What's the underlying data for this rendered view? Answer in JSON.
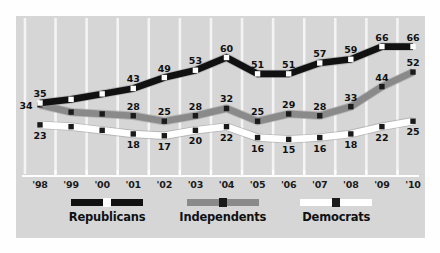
{
  "chart_data": {
    "type": "line",
    "title": "",
    "subtitle": "",
    "xlabel": "",
    "ylabel": "",
    "grid": "vertical",
    "legend_position": "bottom",
    "ylim": [
      10,
      70
    ],
    "categories": [
      "'98",
      "'99",
      "'00",
      "'01",
      "'02",
      "'03",
      "'04",
      "'05",
      "'06",
      "'07",
      "'08",
      "'09",
      "'10"
    ],
    "series": [
      {
        "name": "Republicans",
        "color": "#111111",
        "marker_color": "#ffffff",
        "values": [
          35,
          37,
          40,
          43,
          49,
          53,
          60,
          51,
          51,
          57,
          59,
          66,
          66
        ],
        "labels": [
          "35",
          "",
          "",
          "43",
          "49",
          "53",
          "60",
          "51",
          "51",
          "57",
          "59",
          "66",
          "66"
        ],
        "label_side": [
          "above",
          "",
          "",
          "above",
          "above",
          "above",
          "above",
          "above",
          "above",
          "above",
          "above",
          "above",
          "above"
        ]
      },
      {
        "name": "Independents",
        "color": "#8a8a8a",
        "marker_color": "#1a1a1a",
        "values": [
          34,
          30,
          29,
          28,
          25,
          28,
          32,
          25,
          29,
          28,
          33,
          44,
          52
        ],
        "labels": [
          "34",
          "",
          "",
          "28",
          "25",
          "28",
          "32",
          "25",
          "29",
          "28",
          "33",
          "44",
          "52"
        ],
        "label_side": [
          "left",
          "",
          "",
          "above",
          "above",
          "above",
          "above",
          "above",
          "above",
          "above",
          "above",
          "above",
          "above"
        ]
      },
      {
        "name": "Democrats",
        "color": "#ffffff",
        "marker_color": "#1a1a1a",
        "values": [
          23,
          22,
          20,
          18,
          17,
          20,
          22,
          16,
          15,
          16,
          18,
          22,
          25
        ],
        "labels": [
          "23",
          "",
          "",
          "18",
          "17",
          "20",
          "22",
          "16",
          "15",
          "16",
          "18",
          "22",
          "25"
        ],
        "label_side": [
          "below",
          "",
          "",
          "below",
          "below",
          "below",
          "below",
          "below",
          "below",
          "below",
          "below",
          "below",
          "below"
        ]
      }
    ]
  },
  "legend": {
    "items": [
      {
        "label": "Republicans",
        "line_color": "#111111",
        "marker_color": "#ffffff"
      },
      {
        "label": "Independents",
        "line_color": "#8a8a8a",
        "marker_color": "#1a1a1a"
      },
      {
        "label": "Democrats",
        "line_color": "#ffffff",
        "marker_color": "#1a1a1a"
      }
    ]
  },
  "style": {
    "panel_background": "#d6d6d6",
    "page_background": "#fefefe",
    "gridline_color": "#f4f4f4",
    "axis_color": "#ffffff",
    "text_color": "#111111"
  }
}
